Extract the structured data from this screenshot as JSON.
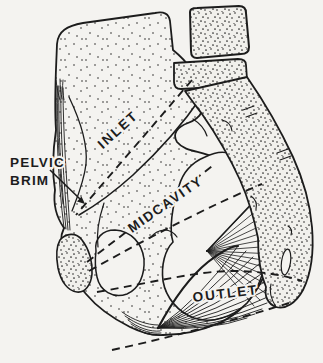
{
  "figure": {
    "type": "anatomical-line-drawing",
    "colors": {
      "ink": "#1c1c1c",
      "paper": "#f4f3f0"
    },
    "labels": {
      "pelvic_brim_line1": "PELVIC",
      "pelvic_brim_line2": "BRIM",
      "inlet": "INLET",
      "midcavity": "MIDCAVITY",
      "outlet": "OUTLET"
    }
  }
}
